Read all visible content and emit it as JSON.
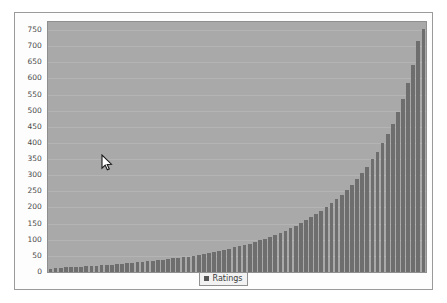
{
  "chart_data": {
    "type": "bar",
    "title": "",
    "subtitle": "",
    "xlabel": "",
    "ylabel": "",
    "grid": true,
    "legend_position": "bottom-center",
    "ylim": [
      0,
      775
    ],
    "yticks": [
      0,
      50,
      100,
      150,
      200,
      250,
      300,
      350,
      400,
      450,
      500,
      550,
      600,
      650,
      700,
      750
    ],
    "ytick_labels": [
      "0",
      "50",
      "100",
      "150",
      "200",
      "250",
      "300",
      "350",
      "400",
      "450",
      "500",
      "550",
      "600",
      "650",
      "700",
      "750"
    ],
    "xticks": [],
    "xtick_labels": [],
    "series": [
      {
        "name": "Ratings",
        "color": "#6e6e6e",
        "values": [
          10,
          12,
          13,
          14,
          15,
          16,
          17,
          18,
          19,
          20,
          21,
          22,
          23,
          24,
          26,
          27,
          28,
          30,
          31,
          33,
          34,
          36,
          38,
          40,
          42,
          44,
          46,
          48,
          51,
          53,
          56,
          59,
          62,
          65,
          68,
          72,
          76,
          80,
          84,
          88,
          93,
          98,
          103,
          109,
          115,
          121,
          128,
          135,
          143,
          151,
          160,
          169,
          179,
          190,
          201,
          213,
          226,
          240,
          255,
          271,
          288,
          307,
          327,
          349,
          373,
          399,
          428,
          460,
          496,
          537,
          585,
          643,
          716,
          752
        ]
      }
    ],
    "legend": [
      {
        "label": "Ratings",
        "color": "#6e6e6e",
        "marker": "square"
      }
    ],
    "colors": {
      "plot_background": "#a9a9a9",
      "panel_background": "#fdfdfd",
      "page_background": "#ffffff",
      "gridline": "#b4b4b4",
      "axis_text": "#4a4a4a",
      "bar": "#6e6e6e",
      "border": "#9a9a9a"
    }
  },
  "legend": {
    "label": "Ratings"
  },
  "cursor": {
    "icon": "arrow-pointer-icon",
    "x": 101,
    "y": 154
  }
}
